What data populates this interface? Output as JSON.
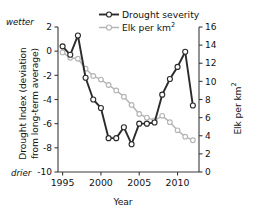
{
  "chart_data": {
    "type": "line",
    "title": "",
    "xlabel": "Year",
    "ylabel": "Drought Index (deviation from long-term average)",
    "ylabel_secondary": "Elk per km2",
    "x": [
      1995,
      1996,
      1997,
      1998,
      1999,
      2000,
      2001,
      2002,
      2003,
      2004,
      2005,
      2006,
      2007,
      2008,
      2009,
      2010,
      2011,
      2012
    ],
    "xlim": [
      1994.4,
      2012.8
    ],
    "xticks": [
      1995,
      2000,
      2005,
      2010
    ],
    "xtick_labels": [
      "1995",
      "2000",
      "2005",
      "2010"
    ],
    "ylim": [
      -10,
      2
    ],
    "yticks": [
      2,
      0,
      -2,
      -4,
      -6,
      -8,
      -10
    ],
    "ytick_labels": [
      "2",
      "0",
      "-2",
      "-4",
      "-6",
      "-8",
      "-10"
    ],
    "ylim_secondary": [
      0,
      16
    ],
    "yticks_secondary": [
      16,
      14,
      12,
      10,
      8,
      6,
      4,
      2,
      0
    ],
    "ytick_labels_secondary": [
      "16",
      "14",
      "12",
      "10",
      "8",
      "6",
      "4",
      "2",
      "0"
    ],
    "grid": false,
    "legend_position": "top-center",
    "annotations": [
      {
        "name": "wetter",
        "text": "wetter",
        "position": "top-left-axis"
      },
      {
        "name": "drier",
        "text": "drier",
        "position": "bottom-left-axis"
      }
    ],
    "series": [
      {
        "name": "Drought severity",
        "axis": "left",
        "color": "#2b2b2b",
        "marker": "open-circle",
        "values": [
          0.4,
          -0.3,
          1.3,
          -2.2,
          -4.0,
          -4.7,
          -7.2,
          -7.2,
          -6.3,
          -7.7,
          -6.0,
          -6.0,
          -5.9,
          -3.6,
          -2.3,
          -1.3,
          -0.05,
          -4.5
        ]
      },
      {
        "name": "Elk per km2",
        "axis": "right",
        "color": "#b5b5b5",
        "marker": "open-circle",
        "values": [
          13.2,
          12.6,
          12.5,
          11.4,
          10.6,
          10.2,
          9.6,
          9.0,
          8.3,
          7.4,
          6.4,
          6.0,
          5.7,
          6.2,
          5.5,
          4.6,
          3.9,
          3.5
        ]
      }
    ]
  },
  "axes": {
    "left_title_line1": "Drought Index (deviation",
    "left_title_line2": "from long-term average)",
    "right_title_prefix": "Elk per km",
    "right_title_sup": "2",
    "x_title": "Year",
    "note_top": "wetter",
    "note_bottom": "drier"
  },
  "legend": {
    "items": [
      {
        "label": "Drought severity",
        "color": "#2b2b2b"
      },
      {
        "label": "Elk per km",
        "sup": "2",
        "color": "#b5b5b5"
      }
    ]
  }
}
